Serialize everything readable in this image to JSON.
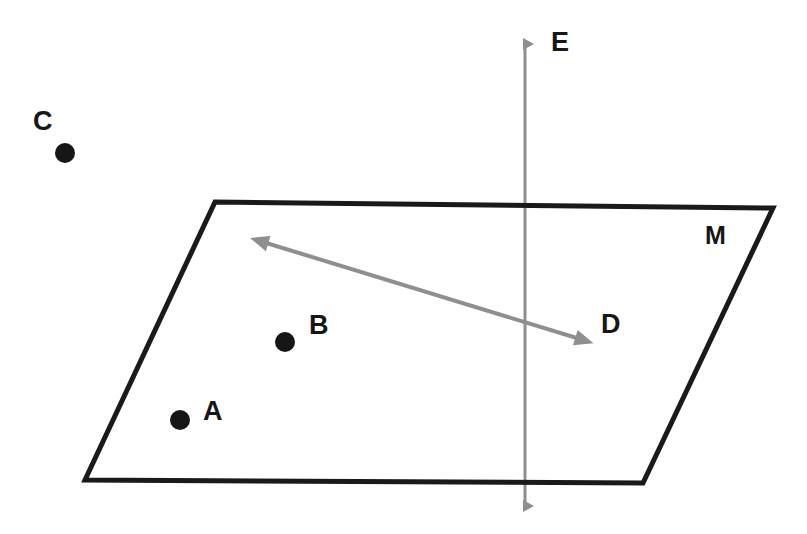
{
  "figure": {
    "background_color": "#ffffff",
    "width": 807,
    "height": 534
  },
  "plane": {
    "label": "M",
    "name": "plane-m",
    "stroke_color": "#1a1a1a",
    "stroke_width": 5,
    "fill": "none",
    "vertices": [
      {
        "name": "top-left",
        "x": 215,
        "y": 202
      },
      {
        "name": "top-right",
        "x": 773,
        "y": 208
      },
      {
        "name": "bottom-right",
        "x": 643,
        "y": 483
      },
      {
        "name": "bottom-left",
        "x": 85,
        "y": 480
      }
    ]
  },
  "points": [
    {
      "label": "A",
      "name": "point-a",
      "cx": 180,
      "cy": 420,
      "r": 10,
      "color": "#161616",
      "in_plane": true,
      "label_x": 212,
      "label_y": 412
    },
    {
      "label": "B",
      "name": "point-b",
      "cx": 285,
      "cy": 342,
      "r": 10,
      "color": "#161616",
      "in_plane": true,
      "label_x": 318,
      "label_y": 326
    },
    {
      "label": "C",
      "name": "point-c",
      "cx": 65,
      "cy": 153,
      "r": 10,
      "color": "#161616",
      "in_plane": false,
      "label_x": 42,
      "label_y": 122
    }
  ],
  "lines": [
    {
      "label": "E",
      "name": "line-e",
      "orientation": "vertical",
      "color": "#8f8f8f",
      "stroke_width": 3,
      "double_headed": true,
      "x1": 525,
      "y1": 32,
      "x2": 525,
      "y2": 518,
      "label_x": 560,
      "label_y": 45,
      "description": "vertical line piercing plane M"
    },
    {
      "label": "D",
      "name": "line-d",
      "orientation": "diagonal",
      "color": "#8f8f8f",
      "stroke_width": 4,
      "double_headed": true,
      "x1": 250,
      "y1": 238,
      "x2": 593,
      "y2": 343,
      "label_x": 610,
      "label_y": 327,
      "description": "diagonal line lying within plane M"
    }
  ],
  "labels": {
    "a": "A",
    "b": "B",
    "c": "C",
    "d": "D",
    "e": "E",
    "m": "M"
  },
  "colors": {
    "ink": "#161616",
    "plane_stroke": "#1a1a1a",
    "line_gray": "#8f8f8f",
    "background": "#ffffff"
  }
}
